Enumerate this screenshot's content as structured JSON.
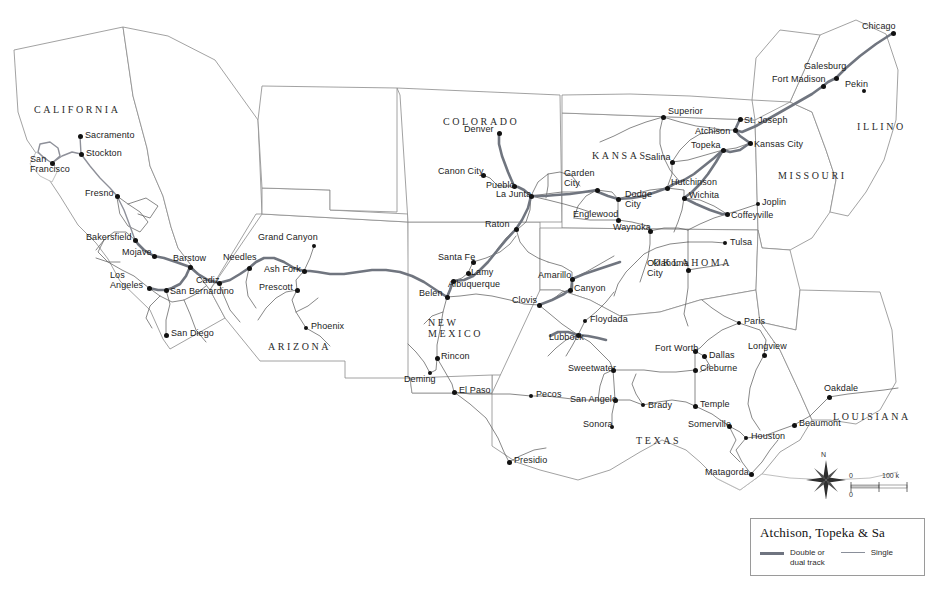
{
  "map": {
    "title_visible": false,
    "background_color": "#ffffff",
    "state_border_color": "#7b7b7b",
    "rail_double_color": "#6f7480",
    "rail_single_color": "#9ba0aa",
    "city_dot_color": "#111111"
  },
  "states": [
    {
      "name": "CALIFORNIA",
      "x": 34,
      "y": 104
    },
    {
      "name": "ARIZONA",
      "x": 268,
      "y": 341
    },
    {
      "name": "NEW\nMEXICO",
      "x": 428,
      "y": 317
    },
    {
      "name": "COLORADO",
      "x": 443,
      "y": 116
    },
    {
      "name": "KANSAS",
      "x": 592,
      "y": 150
    },
    {
      "name": "OKLAHOMA",
      "x": 653,
      "y": 257
    },
    {
      "name": "TEXAS",
      "x": 636,
      "y": 435
    },
    {
      "name": "MISSOURI",
      "x": 778,
      "y": 170
    },
    {
      "name": "ILLINO",
      "x": 857,
      "y": 121
    },
    {
      "name": "LOUISIANA",
      "x": 833,
      "y": 411
    }
  ],
  "cities": [
    {
      "name": "Chicago",
      "dot_x": 893,
      "dot_y": 33,
      "label_x": 862,
      "label_y": 27,
      "align": "left",
      "big": true
    },
    {
      "name": "Galesburg",
      "dot_x": 836,
      "dot_y": 78,
      "label_x": 804,
      "label_y": 67,
      "align": "left",
      "big": true
    },
    {
      "name": "Pekin",
      "dot_x": 864,
      "dot_y": 91,
      "label_x": 845,
      "label_y": 85,
      "align": "left",
      "big": false
    },
    {
      "name": "Fort Madison",
      "dot_x": 823,
      "dot_y": 86,
      "label_x": 772,
      "label_y": 80,
      "align": "left",
      "big": true
    },
    {
      "name": "St. Joseph",
      "dot_x": 740,
      "dot_y": 119,
      "label_x": 744,
      "label_y": 121,
      "align": "left",
      "big": true
    },
    {
      "name": "Kansas City",
      "dot_x": 750,
      "dot_y": 143,
      "label_x": 754,
      "label_y": 145,
      "align": "left",
      "big": true
    },
    {
      "name": "Atchison",
      "dot_x": 735,
      "dot_y": 130,
      "label_x": 695,
      "label_y": 132,
      "align": "left",
      "big": true
    },
    {
      "name": "Topeka",
      "dot_x": 723,
      "dot_y": 150,
      "label_x": 691,
      "label_y": 146,
      "align": "left",
      "big": true
    },
    {
      "name": "Superior",
      "dot_x": 663,
      "dot_y": 117,
      "label_x": 668,
      "label_y": 112,
      "align": "left",
      "big": true
    },
    {
      "name": "Salina",
      "dot_x": 672,
      "dot_y": 162,
      "label_x": 645,
      "label_y": 158,
      "align": "left",
      "big": true
    },
    {
      "name": "Hutchinson",
      "dot_x": 667,
      "dot_y": 188,
      "label_x": 671,
      "label_y": 183,
      "align": "left",
      "big": true
    },
    {
      "name": "Wichita",
      "dot_x": 684,
      "dot_y": 198,
      "label_x": 689,
      "label_y": 196,
      "align": "left",
      "big": true
    },
    {
      "name": "Garden\nCity",
      "dot_x": 597,
      "dot_y": 190,
      "label_x": 564,
      "label_y": 174,
      "align": "left",
      "big": true
    },
    {
      "name": "Dodge\nCity",
      "dot_x": 618,
      "dot_y": 199,
      "label_x": 625,
      "label_y": 195,
      "align": "left",
      "big": true
    },
    {
      "name": "Englewood",
      "dot_x": 618,
      "dot_y": 220,
      "label_x": 573,
      "label_y": 215,
      "align": "left",
      "big": true
    },
    {
      "name": "Waynoka",
      "dot_x": 650,
      "dot_y": 231,
      "label_x": 613,
      "label_y": 228,
      "align": "left",
      "big": true
    },
    {
      "name": "Coffeyville",
      "dot_x": 727,
      "dot_y": 214,
      "label_x": 731,
      "label_y": 216,
      "align": "left",
      "big": true
    },
    {
      "name": "Joplin",
      "dot_x": 758,
      "dot_y": 204,
      "label_x": 762,
      "label_y": 203,
      "align": "left",
      "big": false
    },
    {
      "name": "Tulsa",
      "dot_x": 725,
      "dot_y": 243,
      "label_x": 730,
      "label_y": 243,
      "align": "left",
      "big": false
    },
    {
      "name": "Oklahoma\nCity",
      "dot_x": 688,
      "dot_y": 270,
      "label_x": 647,
      "label_y": 264,
      "align": "left",
      "big": true
    },
    {
      "name": "Denver",
      "dot_x": 499,
      "dot_y": 133,
      "label_x": 464,
      "label_y": 130,
      "align": "left",
      "big": true
    },
    {
      "name": "Canon City",
      "dot_x": 483,
      "dot_y": 175,
      "label_x": 438,
      "label_y": 172,
      "align": "left",
      "big": true
    },
    {
      "name": "Pueblo",
      "dot_x": 514,
      "dot_y": 186,
      "label_x": 486,
      "label_y": 186,
      "align": "left",
      "big": true
    },
    {
      "name": "La Junta",
      "dot_x": 531,
      "dot_y": 196,
      "label_x": 496,
      "label_y": 195,
      "align": "left",
      "big": true
    },
    {
      "name": "Raton",
      "dot_x": 516,
      "dot_y": 229,
      "label_x": 485,
      "label_y": 225,
      "align": "left",
      "big": true
    },
    {
      "name": "Santa Fe",
      "dot_x": 473,
      "dot_y": 262,
      "label_x": 438,
      "label_y": 258,
      "align": "left",
      "big": true
    },
    {
      "name": "Lamy",
      "dot_x": 468,
      "dot_y": 273,
      "label_x": 471,
      "label_y": 273,
      "align": "left",
      "big": true
    },
    {
      "name": "Albuquerque",
      "dot_x": 453,
      "dot_y": 281,
      "label_x": 448,
      "label_y": 285,
      "align": "left",
      "big": true
    },
    {
      "name": "Belen",
      "dot_x": 447,
      "dot_y": 297,
      "label_x": 419,
      "label_y": 294,
      "align": "left",
      "big": true
    },
    {
      "name": "Clovis",
      "dot_x": 539,
      "dot_y": 305,
      "label_x": 512,
      "label_y": 301,
      "align": "left",
      "big": true
    },
    {
      "name": "Rincon",
      "dot_x": 437,
      "dot_y": 358,
      "label_x": 441,
      "label_y": 357,
      "align": "left",
      "big": true
    },
    {
      "name": "Deming",
      "dot_x": 430,
      "dot_y": 373,
      "label_x": 404,
      "label_y": 380,
      "align": "left",
      "big": false
    },
    {
      "name": "El Paso",
      "dot_x": 454,
      "dot_y": 392,
      "label_x": 459,
      "label_y": 391,
      "align": "left",
      "big": true
    },
    {
      "name": "Pecos",
      "dot_x": 531,
      "dot_y": 396,
      "label_x": 536,
      "label_y": 395,
      "align": "left",
      "big": false
    },
    {
      "name": "Presidio",
      "dot_x": 509,
      "dot_y": 462,
      "label_x": 514,
      "label_y": 461,
      "align": "left",
      "big": true
    },
    {
      "name": "Grand Canyon",
      "dot_x": 314,
      "dot_y": 246,
      "label_x": 258,
      "label_y": 238,
      "align": "left",
      "big": false
    },
    {
      "name": "Ash Fork",
      "dot_x": 304,
      "dot_y": 271,
      "label_x": 264,
      "label_y": 270,
      "align": "left",
      "big": true
    },
    {
      "name": "Prescott",
      "dot_x": 297,
      "dot_y": 290,
      "label_x": 259,
      "label_y": 288,
      "align": "left",
      "big": true
    },
    {
      "name": "Phoenix",
      "dot_x": 306,
      "dot_y": 328,
      "label_x": 311,
      "label_y": 327,
      "align": "left",
      "big": false
    },
    {
      "name": "Needles",
      "dot_x": 249,
      "dot_y": 268,
      "label_x": 223,
      "label_y": 258,
      "align": "left",
      "big": true
    },
    {
      "name": "Cadiz",
      "dot_x": 219,
      "dot_y": 283,
      "label_x": 196,
      "label_y": 281,
      "align": "left",
      "big": true
    },
    {
      "name": "Barstow",
      "dot_x": 190,
      "dot_y": 267,
      "label_x": 173,
      "label_y": 259,
      "align": "left",
      "big": true
    },
    {
      "name": "Mojave",
      "dot_x": 154,
      "dot_y": 256,
      "label_x": 122,
      "label_y": 253,
      "align": "left",
      "big": true
    },
    {
      "name": "Bakersfield",
      "dot_x": 135,
      "dot_y": 240,
      "label_x": 86,
      "label_y": 238,
      "align": "left",
      "big": true
    },
    {
      "name": "San Bernardino",
      "dot_x": 166,
      "dot_y": 290,
      "label_x": 170,
      "label_y": 292,
      "align": "left",
      "big": true
    },
    {
      "name": "Los\nAngeles",
      "dot_x": 149,
      "dot_y": 288,
      "label_x": 110,
      "label_y": 276,
      "align": "left",
      "big": true
    },
    {
      "name": "San Diego",
      "dot_x": 166,
      "dot_y": 335,
      "label_x": 171,
      "label_y": 334,
      "align": "left",
      "big": true
    },
    {
      "name": "Fresno",
      "dot_x": 117,
      "dot_y": 196,
      "label_x": 85,
      "label_y": 194,
      "align": "left",
      "big": true
    },
    {
      "name": "Stockton",
      "dot_x": 81,
      "dot_y": 154,
      "label_x": 86,
      "label_y": 154,
      "align": "left",
      "big": true
    },
    {
      "name": "Sacramento",
      "dot_x": 80,
      "dot_y": 136,
      "label_x": 85,
      "label_y": 136,
      "align": "left",
      "big": true
    },
    {
      "name": "San\nFrancisco",
      "dot_x": 52,
      "dot_y": 163,
      "label_x": 30,
      "label_y": 160,
      "align": "left",
      "big": true
    },
    {
      "name": "Amarillo",
      "dot_x": 572,
      "dot_y": 279,
      "label_x": 538,
      "label_y": 276,
      "align": "left",
      "big": true
    },
    {
      "name": "Canyon",
      "dot_x": 570,
      "dot_y": 290,
      "label_x": 574,
      "label_y": 289,
      "align": "left",
      "big": true
    },
    {
      "name": "Floydada",
      "dot_x": 585,
      "dot_y": 321,
      "label_x": 590,
      "label_y": 320,
      "align": "left",
      "big": false
    },
    {
      "name": "Lubbock",
      "dot_x": 578,
      "dot_y": 335,
      "label_x": 549,
      "label_y": 338,
      "align": "left",
      "big": true
    },
    {
      "name": "Sweetwater",
      "dot_x": 613,
      "dot_y": 370,
      "label_x": 568,
      "label_y": 369,
      "align": "left",
      "big": true
    },
    {
      "name": "San Angelo",
      "dot_x": 615,
      "dot_y": 400,
      "label_x": 570,
      "label_y": 400,
      "align": "left",
      "big": true
    },
    {
      "name": "Sonora",
      "dot_x": 612,
      "dot_y": 427,
      "label_x": 583,
      "label_y": 425,
      "align": "left",
      "big": false
    },
    {
      "name": "Brady",
      "dot_x": 643,
      "dot_y": 405,
      "label_x": 648,
      "label_y": 406,
      "align": "left",
      "big": false
    },
    {
      "name": "Fort Worth",
      "dot_x": 695,
      "dot_y": 351,
      "label_x": 655,
      "label_y": 349,
      "align": "left",
      "big": true
    },
    {
      "name": "Dallas",
      "dot_x": 704,
      "dot_y": 356,
      "label_x": 709,
      "label_y": 356,
      "align": "left",
      "big": true
    },
    {
      "name": "Cleburne",
      "dot_x": 695,
      "dot_y": 370,
      "label_x": 700,
      "label_y": 369,
      "align": "left",
      "big": true
    },
    {
      "name": "Temple",
      "dot_x": 695,
      "dot_y": 406,
      "label_x": 700,
      "label_y": 405,
      "align": "left",
      "big": true
    },
    {
      "name": "Somerville",
      "dot_x": 729,
      "dot_y": 426,
      "label_x": 688,
      "label_y": 425,
      "align": "left",
      "big": true
    },
    {
      "name": "Houston",
      "dot_x": 746,
      "dot_y": 438,
      "label_x": 751,
      "label_y": 437,
      "align": "left",
      "big": false
    },
    {
      "name": "Matagorda",
      "dot_x": 751,
      "dot_y": 474,
      "label_x": 705,
      "label_y": 473,
      "align": "left",
      "big": true
    },
    {
      "name": "Beaumont",
      "dot_x": 794,
      "dot_y": 425,
      "label_x": 799,
      "label_y": 424,
      "align": "left",
      "big": true
    },
    {
      "name": "Paris",
      "dot_x": 739,
      "dot_y": 323,
      "label_x": 744,
      "label_y": 322,
      "align": "left",
      "big": false
    },
    {
      "name": "Longview",
      "dot_x": 764,
      "dot_y": 355,
      "label_x": 748,
      "label_y": 347,
      "align": "left",
      "big": true
    },
    {
      "name": "Oakdale",
      "dot_x": 829,
      "dot_y": 397,
      "label_x": 824,
      "label_y": 389,
      "align": "left",
      "big": true
    }
  ],
  "legend": {
    "title": "Atchison, Topeka & Sa",
    "items": [
      {
        "label": "Double or\ndual track",
        "style": "thick"
      },
      {
        "label": "Single",
        "style": "thin"
      }
    ]
  },
  "compass": {
    "north_label": "N"
  },
  "scalebar": {
    "top_left_label": "0",
    "top_right_label": "100 k",
    "bottom_left_label": "0"
  }
}
